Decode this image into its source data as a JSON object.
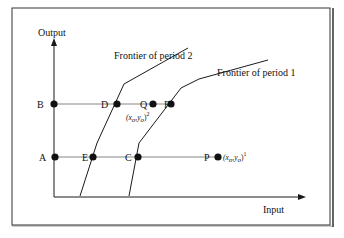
{
  "figure": {
    "axes": {
      "y_label": "Output",
      "x_label": "Input"
    },
    "frontiers": [
      {
        "id": "period2",
        "label": "Frontier of period 2"
      },
      {
        "id": "period1",
        "label": "Frontier of period 1"
      }
    ],
    "points": {
      "A": "A",
      "B": "B",
      "C": "C",
      "D": "D",
      "E": "E",
      "F": "F",
      "P": "P",
      "Q": "Q"
    },
    "annotations": {
      "q_obs_main": "(x",
      "q_obs_sub1": "o",
      "q_obs_mid": ",y",
      "q_obs_sub2": "o",
      "q_obs_close": ")",
      "q_obs_sup": "2",
      "p_obs_main": "(x",
      "p_obs_sub1": "o",
      "p_obs_mid": ",y",
      "p_obs_sub2": "o",
      "p_obs_close": ")",
      "p_obs_sup": "1"
    },
    "colors": {
      "line": "#1a1a1a",
      "guide": "#555555",
      "frame": "#333333",
      "background": "#ffffff"
    }
  }
}
